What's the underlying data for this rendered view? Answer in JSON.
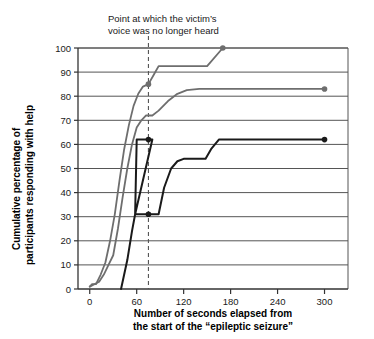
{
  "chart_data": {
    "type": "line",
    "title": "",
    "subtitle": "",
    "xlabel_line1": "Number of seconds elapsed from",
    "xlabel_line2": "the start of the “epileptic seizure”",
    "ylabel_line1": "Cumulative percentage of",
    "ylabel_line2": "participants responding with help",
    "xlim": [
      -15,
      330
    ],
    "ylim": [
      0,
      100
    ],
    "xticks": [
      0,
      60,
      120,
      180,
      240,
      300
    ],
    "xtick_labels": [
      "0",
      "60",
      "120",
      "180",
      "240",
      "300"
    ],
    "yticks": [
      0,
      10,
      20,
      30,
      40,
      50,
      60,
      70,
      80,
      90,
      100
    ],
    "ytick_labels": [
      "0",
      "10",
      "20",
      "30",
      "40",
      "50",
      "60",
      "70",
      "80",
      "90",
      "100"
    ],
    "grid": "horizontal",
    "legend": "none",
    "annotations": [
      {
        "name": "voice-no-longer-heard",
        "text_line1": "Point at which the victim’s",
        "text_line2": "voice was no longer heard",
        "x": 75,
        "style": "dashed-vertical-line",
        "color": "#555555"
      }
    ],
    "series": [
      {
        "name": "group-1-fastest",
        "color": "#6e6e6e",
        "points": [
          [
            0,
            1
          ],
          [
            3,
            2
          ],
          [
            8,
            2
          ],
          [
            14,
            6
          ],
          [
            20,
            11
          ],
          [
            26,
            20
          ],
          [
            32,
            31
          ],
          [
            38,
            45
          ],
          [
            44,
            58
          ],
          [
            50,
            68
          ],
          [
            56,
            76
          ],
          [
            62,
            81
          ],
          [
            68,
            84
          ],
          [
            75,
            85
          ],
          [
            82,
            89
          ],
          [
            88,
            92.5
          ],
          [
            150,
            92.5
          ],
          [
            170,
            100
          ]
        ],
        "marker_at_dashed": [
          75,
          85
        ],
        "endpoint": [
          170,
          100
        ],
        "endpoint_marker": true
      },
      {
        "name": "group-2-middle",
        "color": "#6e6e6e",
        "points": [
          [
            0,
            1
          ],
          [
            6,
            2
          ],
          [
            12,
            3
          ],
          [
            18,
            6
          ],
          [
            24,
            10
          ],
          [
            30,
            14
          ],
          [
            36,
            25
          ],
          [
            42,
            38
          ],
          [
            48,
            50
          ],
          [
            54,
            60
          ],
          [
            60,
            67
          ],
          [
            66,
            70
          ],
          [
            72,
            72
          ],
          [
            80,
            72
          ],
          [
            88,
            74
          ],
          [
            100,
            78
          ],
          [
            112,
            81
          ],
          [
            124,
            82.5
          ],
          [
            140,
            83
          ],
          [
            300,
            83
          ]
        ],
        "endpoint": [
          300,
          83
        ],
        "endpoint_marker": true
      },
      {
        "name": "group-3-slowest",
        "color": "#1a1a1a",
        "points": [
          [
            40,
            0
          ],
          [
            48,
            12
          ],
          [
            54,
            24
          ],
          [
            58,
            31
          ],
          [
            60,
            62
          ],
          [
            62,
            62
          ],
          [
            68,
            62
          ],
          [
            75,
            62
          ],
          [
            80,
            62
          ],
          [
            58,
            31
          ],
          [
            75,
            31
          ],
          [
            88,
            31
          ],
          [
            95,
            42
          ],
          [
            104,
            50
          ],
          [
            112,
            53
          ],
          [
            120,
            54
          ],
          [
            148,
            54
          ],
          [
            155,
            58
          ],
          [
            165,
            62
          ],
          [
            300,
            62
          ]
        ],
        "markers_at_dashed": [
          [
            75,
            62
          ],
          [
            75,
            31
          ]
        ],
        "endpoint": [
          300,
          62
        ],
        "endpoint_marker": true
      }
    ]
  },
  "colors": {
    "grid": "#555555",
    "axis": "#333333",
    "grey_series": "#6e6e6e",
    "black_series": "#1a1a1a",
    "dashed": "#555555",
    "text": "#1a1a1a"
  }
}
